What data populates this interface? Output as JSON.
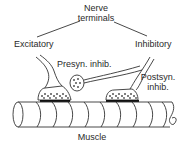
{
  "diagram": {
    "labels": {
      "nerve_terminals_line1": "Nerve",
      "nerve_terminals_line2": "terminals",
      "excitatory": "Excitatory",
      "inhibitory": "Inhibitory",
      "presynaptic_inhibition": "Presyn. inhib.",
      "postsynaptic_inhibition_line1": "Postsyn.",
      "postsynaptic_inhibition_line2": "inhib.",
      "muscle": "Muscle"
    },
    "colors": {
      "line": "#333333",
      "background": "#ffffff",
      "endplate": "#111111"
    }
  }
}
